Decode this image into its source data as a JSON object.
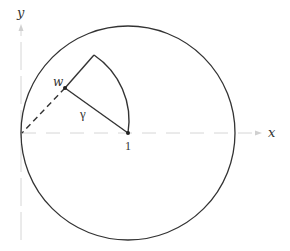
{
  "diagram": {
    "axes": {
      "x_label": "x",
      "y_label": "y"
    },
    "points": {
      "one_label": "1",
      "w_label": "w"
    },
    "path_label": "γ",
    "colors": {
      "stroke": "#333333",
      "axis": "#cccccc"
    }
  }
}
